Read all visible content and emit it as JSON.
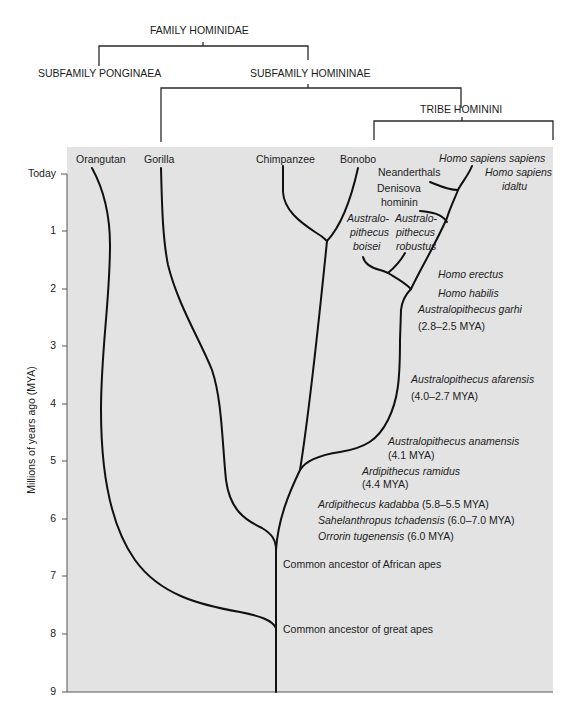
{
  "taxonomy": {
    "family": "FAMILY HOMINIDAE",
    "subfamily_left": "SUBFAMILY PONGINAEA",
    "subfamily_right": "SUBFAMILY HOMININAE",
    "tribe": "TRIBE HOMININI"
  },
  "axis": {
    "label": "Millions of years ago (MYA)",
    "ticks": [
      "Today",
      "1",
      "2",
      "3",
      "4",
      "5",
      "6",
      "7",
      "8",
      "9"
    ]
  },
  "species": {
    "orangutan": "Orangutan",
    "gorilla": "Gorilla",
    "chimpanzee": "Chimpanzee",
    "bonobo": "Bonobo",
    "homo_sapiens_sapiens": "Homo sapiens sapiens",
    "homo_sapiens_idaltu_1": "Homo sapiens",
    "homo_sapiens_idaltu_2": "idaltu",
    "neanderthals": "Neanderthals",
    "denisova_1": "Denisova",
    "denisova_2": "hominin",
    "boisei_1": "Australo-",
    "boisei_2": "pithecus",
    "boisei_3": "boisei",
    "robustus_1": "Australo-",
    "robustus_2": "pithecus",
    "robustus_3": "robustus",
    "homo_erectus": "Homo erectus",
    "homo_habilis": "Homo habilis",
    "garhi_name": "Australopithecus garhi",
    "garhi_date": "(2.8–2.5 MYA)",
    "afarensis_name": "Australopithecus afarensis",
    "afarensis_date": "(4.0–2.7 MYA)",
    "anamensis_name": "Australopithecus anamensis",
    "anamensis_date": "(4.1 MYA)",
    "ramidus_name": "Ardipithecus ramidus",
    "ramidus_date": "(4.4 MYA)",
    "kadabba_name": "Ardipithecus kadabba",
    "kadabba_date": " (5.8–5.5 MYA)",
    "sahelanthropus_name": "Sahelanthropus tchadensis",
    "sahelanthropus_date": " (6.0–7.0 MYA)",
    "orrorin_name": "Orrorin tugenensis",
    "orrorin_date": " (6.0 MYA)"
  },
  "nodes": {
    "african_apes": "Common ancestor of African apes",
    "great_apes": "Common ancestor of great apes"
  },
  "colors": {
    "plot_background": "#e3e3e3",
    "line": "#111111"
  }
}
